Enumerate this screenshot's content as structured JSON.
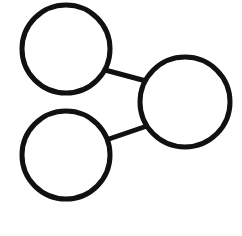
{
  "figure": {
    "title": "",
    "background_color": "#ffffff",
    "width": 242,
    "height": 236
  },
  "diagram": {
    "type": "node-link-graph",
    "stroke_color": "#111111",
    "node_fill_color": "#ffffff",
    "node_stroke_width": 5,
    "edge_stroke_width": 5,
    "nodes": [
      {
        "id": "node-top-left",
        "label": "",
        "cx": 66,
        "cy": 49,
        "r": 44
      },
      {
        "id": "node-bottom-left",
        "label": "",
        "cx": 66,
        "cy": 155,
        "r": 44
      },
      {
        "id": "node-right",
        "label": "",
        "cx": 185,
        "cy": 102,
        "r": 45
      }
    ],
    "edges": [
      {
        "id": "edge-top-left-to-right",
        "source": "node-top-left",
        "target": "node-right",
        "x1": 105,
        "y1": 70,
        "x2": 146,
        "y2": 81
      },
      {
        "id": "edge-bottom-left-to-right",
        "source": "node-bottom-left",
        "target": "node-right",
        "x1": 106,
        "y1": 140,
        "x2": 147,
        "y2": 126
      }
    ]
  }
}
